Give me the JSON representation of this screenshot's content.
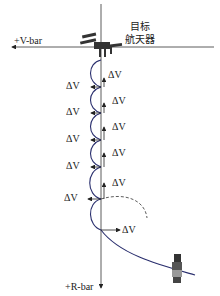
{
  "axes": {
    "v_bar_label": "+V-bar",
    "r_bar_label": "+R-bar"
  },
  "target": {
    "label_line1": "目标",
    "label_line2": "航天器",
    "icon": "space-station-icon"
  },
  "chaser": {
    "icon": "chaser-spacecraft-icon"
  },
  "delta_v_label": "ΔV",
  "maneuvers": {
    "left_labels": [
      "ΔV",
      "ΔV",
      "ΔV",
      "ΔV",
      "ΔV"
    ],
    "right_labels": [
      "ΔV",
      "ΔV",
      "ΔV",
      "ΔV",
      "ΔV",
      "ΔV"
    ],
    "final_label": "ΔV"
  },
  "colors": {
    "trajectory": "#2a2f6e",
    "axis": "#333333",
    "text": "#222222"
  }
}
